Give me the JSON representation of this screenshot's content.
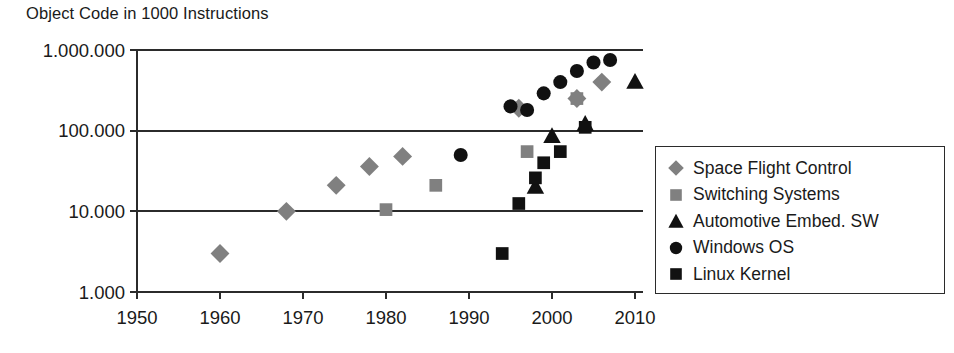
{
  "chart_data": {
    "type": "scatter",
    "title": "Object Code in 1000 Instructions",
    "xlabel": "",
    "ylabel": "",
    "yscale": "log",
    "ylim": [
      1000,
      1000000
    ],
    "xlim": [
      1950,
      2012
    ],
    "grid": true,
    "legend_position": "right",
    "ytick_labels": [
      "1.000.000",
      "100.000",
      "10.000",
      "1.000"
    ],
    "ytick_values": [
      1000000,
      100000,
      10000,
      1000
    ],
    "xtick_labels": [
      "1950",
      "1960",
      "1970",
      "1980",
      "1990",
      "2000",
      "2010"
    ],
    "xtick_values": [
      1950,
      1960,
      1970,
      1980,
      1990,
      2000,
      2010
    ],
    "series": [
      {
        "name": "Space Flight Control",
        "marker": "diamond",
        "color": "#808080",
        "points": [
          {
            "x": 1960,
            "y": 3000
          },
          {
            "x": 1968,
            "y": 10000
          },
          {
            "x": 1974,
            "y": 21000
          },
          {
            "x": 1978,
            "y": 36000
          },
          {
            "x": 1982,
            "y": 48000
          },
          {
            "x": 1996,
            "y": 190000
          },
          {
            "x": 2003,
            "y": 250000
          },
          {
            "x": 2006,
            "y": 400000
          }
        ]
      },
      {
        "name": "Switching Systems",
        "marker": "square",
        "color": "#808080",
        "points": [
          {
            "x": 1980,
            "y": 10500
          },
          {
            "x": 1986,
            "y": 21000
          },
          {
            "x": 1997,
            "y": 55000
          },
          {
            "x": 2003,
            "y": 250000
          }
        ]
      },
      {
        "name": "Automotive Embed. SW",
        "marker": "triangle",
        "color": "#111111",
        "points": [
          {
            "x": 1998,
            "y": 20000
          },
          {
            "x": 2000,
            "y": 85000
          },
          {
            "x": 2004,
            "y": 120000
          },
          {
            "x": 2010,
            "y": 400000
          }
        ]
      },
      {
        "name": "Windows OS",
        "marker": "circle",
        "color": "#111111",
        "points": [
          {
            "x": 1989,
            "y": 50000
          },
          {
            "x": 1995,
            "y": 200000
          },
          {
            "x": 1997,
            "y": 180000
          },
          {
            "x": 1999,
            "y": 290000
          },
          {
            "x": 2001,
            "y": 400000
          },
          {
            "x": 2003,
            "y": 550000
          },
          {
            "x": 2005,
            "y": 700000
          },
          {
            "x": 2007,
            "y": 750000
          }
        ]
      },
      {
        "name": "Linux Kernel",
        "marker": "square",
        "color": "#111111",
        "points": [
          {
            "x": 1994,
            "y": 3000
          },
          {
            "x": 1996,
            "y": 12500
          },
          {
            "x": 1998,
            "y": 26000
          },
          {
            "x": 1999,
            "y": 40000
          },
          {
            "x": 2001,
            "y": 55000
          },
          {
            "x": 2004,
            "y": 110000
          }
        ]
      }
    ]
  },
  "legend": {
    "items": [
      {
        "label": "Space Flight Control",
        "marker": "diamond",
        "color": "#808080"
      },
      {
        "label": "Switching Systems",
        "marker": "square",
        "color": "#808080"
      },
      {
        "label": "Automotive Embed. SW",
        "marker": "triangle",
        "color": "#111111"
      },
      {
        "label": "Windows OS",
        "marker": "circle",
        "color": "#111111"
      },
      {
        "label": "Linux Kernel",
        "marker": "square",
        "color": "#111111"
      }
    ]
  }
}
